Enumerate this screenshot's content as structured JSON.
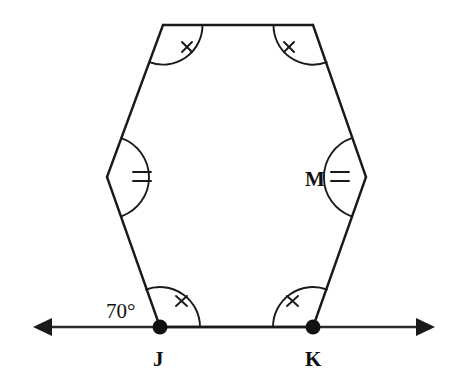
{
  "figure": {
    "type": "geometry-diagram",
    "canvas": {
      "width": 459,
      "height": 375
    },
    "stroke_color": "#1a1a1a",
    "background_color": "#ffffff"
  },
  "labels": {
    "angle_j_exterior": "70°",
    "point_j": "J",
    "point_k": "K",
    "vertex_m": "M"
  },
  "vertices": [
    {
      "id": "top-left",
      "name": "vertex-top-left",
      "x": 163,
      "y": 25,
      "mark": "single-tick"
    },
    {
      "id": "top-right",
      "name": "vertex-top-right",
      "x": 313,
      "y": 25,
      "mark": "single-tick"
    },
    {
      "id": "right-middle",
      "name": "vertex-m",
      "x": 366,
      "y": 177,
      "mark": "double-tick",
      "label": "M"
    },
    {
      "id": "k",
      "name": "vertex-k",
      "x": 313,
      "y": 327,
      "mark": "single-tick",
      "label": "K",
      "dot": true
    },
    {
      "id": "j",
      "name": "vertex-j",
      "x": 160,
      "y": 327,
      "mark": "single-tick",
      "label": "J",
      "dot": true
    },
    {
      "id": "left-middle",
      "name": "vertex-left-middle",
      "x": 107,
      "y": 177,
      "mark": "double-tick"
    }
  ],
  "edges": [
    {
      "from": "top-left",
      "to": "top-right"
    },
    {
      "from": "top-right",
      "to": "right-middle"
    },
    {
      "from": "right-middle",
      "to": "k"
    },
    {
      "from": "k",
      "to": "j"
    },
    {
      "from": "j",
      "to": "left-middle"
    },
    {
      "from": "left-middle",
      "to": "top-left"
    }
  ],
  "transversal": {
    "name": "horizontal-line",
    "y": 327,
    "x_start": 33,
    "x_end": 435,
    "arrow_left": true,
    "arrow_right": true
  },
  "label_positions": {
    "angle_j_exterior": {
      "x": 106,
      "y": 318
    },
    "point_j": {
      "x": 153,
      "y": 366
    },
    "point_k": {
      "x": 305,
      "y": 366
    },
    "vertex_m": {
      "x": 305,
      "y": 186
    }
  }
}
